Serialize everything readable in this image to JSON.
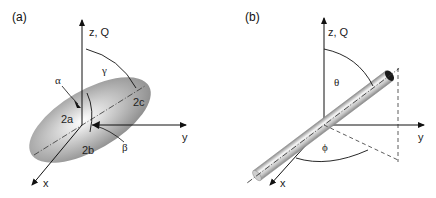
{
  "panels": [
    {
      "id": "a",
      "label": "(a)",
      "shape": "ellipsoid",
      "axes": {
        "z": "z, Q",
        "y": "y",
        "x": "x"
      },
      "annotations": {
        "alpha": "α",
        "beta": "β",
        "gamma": "γ",
        "a": "2a",
        "b": "2b",
        "c": "2c"
      }
    },
    {
      "id": "b",
      "label": "(b)",
      "shape": "cylinder",
      "axes": {
        "z": "z, Q",
        "y": "y",
        "x": "x"
      },
      "annotations": {
        "theta": "θ",
        "phi": "ϕ"
      }
    }
  ],
  "colors": {
    "axis": "#111111",
    "shape_dark": "#8a8a8a",
    "shape_light": "#f4f4f4",
    "cap": "#1a1a1a"
  }
}
